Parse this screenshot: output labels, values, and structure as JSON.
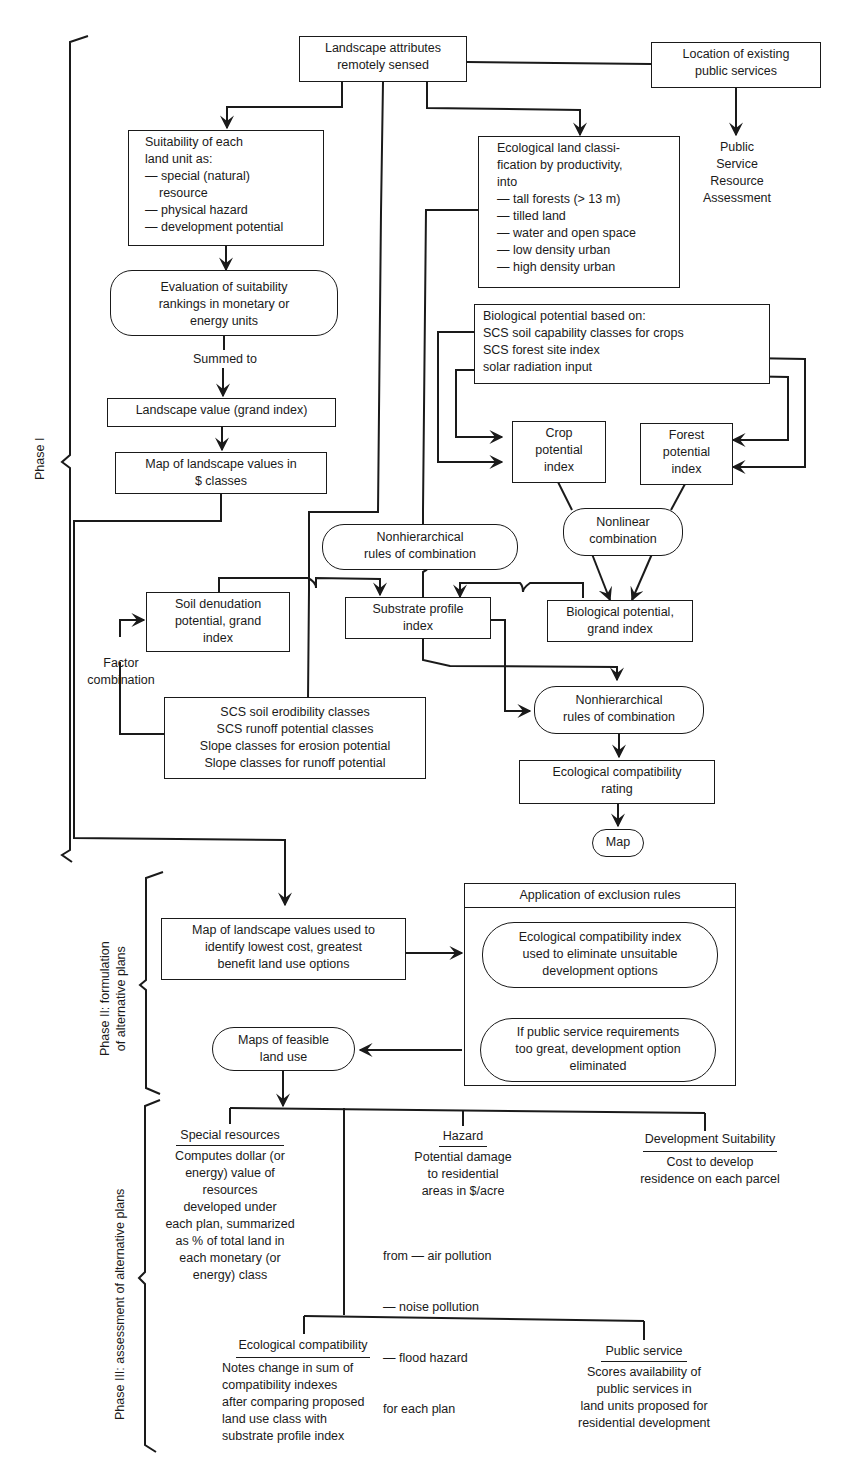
{
  "phases": {
    "phase1": "Phase I",
    "phase2_line1": "Phase II:  formulation",
    "phase2_line2": "of alternative plans",
    "phase3": "Phase III:  assessment of alternative plans"
  },
  "nodes": {
    "landscape_attributes": [
      "Landscape attributes",
      "remotely sensed"
    ],
    "public_services_location": [
      "Location of existing",
      "public services"
    ],
    "public_service_assessment": [
      "Public",
      "Service",
      "Resource",
      "Assessment"
    ],
    "suitability": [
      "Suitability of each",
      "land unit as:",
      "— special (natural)",
      "   resource",
      "— physical hazard",
      "— development potential"
    ],
    "evaluation": [
      "Evaluation of suitability",
      "rankings in monetary or",
      "energy units"
    ],
    "summed_to": "Summed to",
    "landscape_value": "Landscape value (grand index)",
    "map_landscape_values": [
      "Map of landscape values in",
      "$ classes"
    ],
    "ecological_classification": [
      "Ecological land classi-",
      "fication by productivity,",
      "into",
      "— tall forests (> 13 m)",
      "— tilled land",
      "— water and open space",
      "— low density urban",
      "— high density urban"
    ],
    "biological_basis": [
      "Biological potential based on:",
      "SCS soil capability classes for crops",
      "SCS forest site index",
      "solar radiation input"
    ],
    "crop_potential": [
      "Crop",
      "potential",
      "index"
    ],
    "forest_potential": [
      "Forest",
      "potential",
      "index"
    ],
    "nonlinear_combination": [
      "Nonlinear",
      "combination"
    ],
    "nonhierarchical_rules_1": [
      "Nonhierarchical",
      "rules of combination"
    ],
    "soil_denudation": [
      "Soil denudation",
      "potential, grand",
      "index"
    ],
    "substrate_profile": [
      "Substrate profile",
      "index"
    ],
    "biological_grand": [
      "Biological potential,",
      "grand index"
    ],
    "factor_combination": [
      "Factor",
      "combination"
    ],
    "scs_classes": [
      "SCS soil erodibility classes",
      "SCS runoff potential classes",
      "Slope classes for erosion potential",
      "Slope classes for runoff potential"
    ],
    "nonhierarchical_rules_2": [
      "Nonhierarchical",
      "rules of combination"
    ],
    "ecological_compatibility_rating": [
      "Ecological compatibility",
      "rating"
    ],
    "map": "Map",
    "map_landscape_options": [
      "Map of landscape values used to",
      "identify lowest cost, greatest",
      "benefit land use options"
    ],
    "exclusion_rules_title": "Application of exclusion rules",
    "exclusion_eco": [
      "Ecological compatibility index",
      "used to eliminate unsuitable",
      "development options"
    ],
    "exclusion_public": [
      "If public service requirements",
      "too great, development option",
      "eliminated"
    ],
    "feasible_maps": [
      "Maps of feasible",
      "land use"
    ]
  },
  "assessments": {
    "special_resources": {
      "title": "Special resources",
      "body": [
        "Computes dollar (or",
        "energy) value of",
        "resources",
        "developed under",
        "each plan, summarized",
        "as % of total land in",
        "each monetary (or",
        "energy) class"
      ]
    },
    "hazard": {
      "title": "Hazard",
      "body": [
        "Potential damage",
        "to residential",
        "areas in $/acre"
      ],
      "list": [
        "from — air pollution",
        "         — noise pollution",
        "         — flood hazard",
        "for each plan"
      ]
    },
    "development_suitability": {
      "title": "Development Suitability",
      "body": [
        "Cost to develop",
        "residence on each parcel"
      ]
    },
    "ecological_compatibility": {
      "title": "Ecological compatibility",
      "body": [
        "Notes change in sum of",
        "compatibility indexes",
        "after comparing proposed",
        "land use class with",
        "substrate profile index"
      ]
    },
    "public_service": {
      "title": "Public service",
      "body": [
        "Scores availability of",
        "public services in",
        "land units proposed for",
        "residential development"
      ]
    }
  },
  "colors": {
    "ink": "#1a1a1a",
    "paper": "#ffffff"
  }
}
